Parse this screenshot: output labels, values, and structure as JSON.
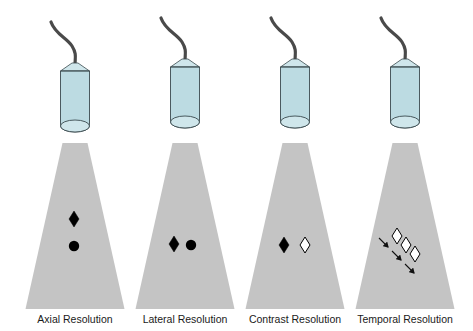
{
  "figure": {
    "colors": {
      "cable": "#4a4a4a",
      "transducer_fill": "#bcdbe2",
      "transducer_cap": "#cfe6eb",
      "transducer_stroke": "#3a4a4e",
      "beam": "#c4c4c4",
      "target_dark": "#000000",
      "target_light": "#ffffff",
      "arrow": "#111111"
    },
    "panels": [
      {
        "id": "axial",
        "label": "Axial Resolution",
        "cx": 75,
        "targets": [
          {
            "shape": "diamond",
            "fill": "dark",
            "x": 74,
            "y": 219
          },
          {
            "shape": "circle",
            "fill": "dark",
            "x": 74,
            "y": 246
          }
        ]
      },
      {
        "id": "lateral",
        "label": "Lateral Resolution",
        "cx": 185,
        "targets": [
          {
            "shape": "diamond",
            "fill": "dark",
            "x": 174,
            "y": 244
          },
          {
            "shape": "circle",
            "fill": "dark",
            "x": 191,
            "y": 245
          }
        ]
      },
      {
        "id": "contrast",
        "label": "Contrast Resolution",
        "cx": 295,
        "targets": [
          {
            "shape": "diamond",
            "fill": "dark",
            "x": 284,
            "y": 245
          },
          {
            "shape": "diamond",
            "fill": "light",
            "x": 305,
            "y": 245
          }
        ]
      },
      {
        "id": "temporal",
        "label": "Temporal Resolution",
        "cx": 405,
        "targets": [
          {
            "shape": "diamond",
            "fill": "light",
            "x": 397,
            "y": 236
          },
          {
            "shape": "diamond",
            "fill": "light",
            "x": 406,
            "y": 245
          },
          {
            "shape": "diamond",
            "fill": "light",
            "x": 415,
            "y": 254
          }
        ],
        "arrows": [
          {
            "x1": 379,
            "y1": 238,
            "x2": 388,
            "y2": 247
          },
          {
            "x1": 392,
            "y1": 251,
            "x2": 401,
            "y2": 260
          },
          {
            "x1": 405,
            "y1": 264,
            "x2": 414,
            "y2": 273
          }
        ]
      }
    ]
  }
}
